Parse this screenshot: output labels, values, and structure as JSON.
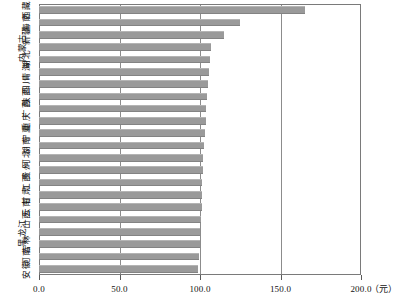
{
  "chart_data": {
    "type": "bar",
    "orientation": "horizontal",
    "title": "",
    "xlabel": "",
    "ylabel": "",
    "unit": "（元）",
    "xlim": [
      0.0,
      200.0
    ],
    "grid": true,
    "gridlines": [
      50.0,
      100.0,
      150.0
    ],
    "legend": "none",
    "xticks": [
      "0.0",
      "50.0",
      "100.0",
      "150.0",
      "200.0"
    ],
    "xtick_values": [
      0.0,
      50.0,
      100.0,
      150.0,
      200.0
    ],
    "categories": [
      "西藏",
      "海南",
      "新疆",
      "内蒙古",
      "湖北",
      "青海",
      "四川",
      "陕西",
      "广西",
      "重庆",
      "宁夏",
      "湖南",
      "河北",
      "贵州",
      "江西",
      "甘肃",
      "云南",
      "山西",
      "黑龙江",
      "吉林",
      "河南",
      "安徽"
    ],
    "values": [
      165.0,
      125.0,
      115.0,
      107.0,
      106.0,
      105.5,
      105.0,
      104.5,
      104.0,
      103.5,
      103.0,
      102.5,
      102.0,
      102.0,
      101.5,
      101.0,
      101.0,
      100.5,
      100.0,
      100.0,
      99.5,
      99.0
    ]
  },
  "style": {
    "bar_color": "#9a9a9a",
    "frame_color": "#7a7a7a",
    "grid_color": "#8c8c8c",
    "text_color": "#111111",
    "background": "#ffffff"
  }
}
